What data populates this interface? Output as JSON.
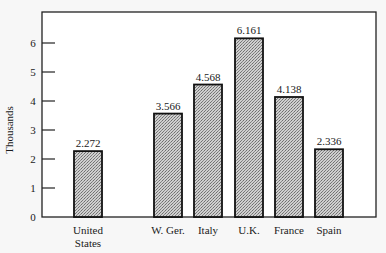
{
  "chart_data": {
    "type": "bar",
    "title": "",
    "xlabel": "",
    "ylabel": "Thousands",
    "ylim": [
      0,
      7
    ],
    "yticks": [
      0,
      1,
      2,
      3,
      4,
      5,
      6
    ],
    "grid": false,
    "legend": "none",
    "categories": [
      "United\nStates",
      "W. Ger.",
      "Italy",
      "U.K.",
      "France",
      "Spain"
    ],
    "values": [
      2.272,
      3.566,
      4.568,
      6.161,
      4.138,
      2.336
    ],
    "data_labels": [
      "2.272",
      "3.566",
      "4.568",
      "6.161",
      "4.138",
      "2.336"
    ],
    "bar_fill": "#b8b8b8",
    "bar_stroke": "#111111"
  }
}
